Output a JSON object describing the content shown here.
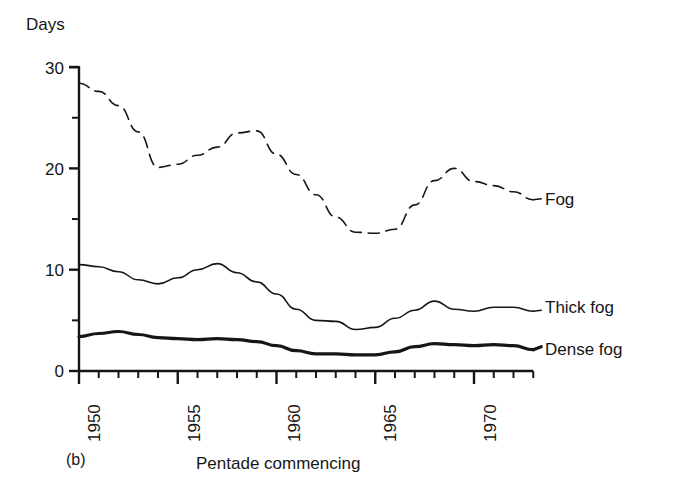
{
  "figure": {
    "panel_letter": "(b)",
    "y_axis_title": "Days",
    "x_axis_title": "Pentade commencing",
    "ink_color": "#161616",
    "background_color": "#ffffff"
  },
  "axes": {
    "y_tick_labels": [
      "30",
      "20",
      "10",
      "0"
    ],
    "y_minor_ticks": [
      25,
      15,
      5
    ],
    "x_tick_labels": [
      "1950",
      "1955",
      "1960",
      "1965",
      "1970"
    ]
  },
  "series_labels": {
    "fog": "Fog",
    "thick_fog": "Thick fog",
    "dense_fog": "Dense fog"
  },
  "chart_data": {
    "type": "line",
    "title": "",
    "subtitle": "",
    "xlabel": "Pentade commencing",
    "ylabel": "Days",
    "xlim": [
      1950,
      1973
    ],
    "ylim": [
      0,
      30
    ],
    "yticks": [
      0,
      5,
      10,
      15,
      20,
      25,
      30
    ],
    "ytick_labels_shown": [
      0,
      10,
      20,
      30
    ],
    "xticks": [
      1950,
      1951,
      1952,
      1953,
      1954,
      1955,
      1956,
      1957,
      1958,
      1959,
      1960,
      1961,
      1962,
      1963,
      1964,
      1965,
      1966,
      1967,
      1968,
      1969,
      1970,
      1971,
      1972,
      1973
    ],
    "xticks_labelled": [
      1950,
      1955,
      1960,
      1965,
      1970
    ],
    "grid": false,
    "legend_position": "right-inline-labels",
    "series": [
      {
        "name": "Fog",
        "style": "dashed",
        "line_width": 1.6,
        "label_at": {
          "x": 1973,
          "y": 17.0
        },
        "x": [
          1950,
          1951,
          1952,
          1953,
          1954,
          1955,
          1956,
          1957,
          1958,
          1959,
          1960,
          1961,
          1962,
          1963,
          1964,
          1965,
          1966,
          1967,
          1968,
          1969,
          1970,
          1971,
          1972,
          1973
        ],
        "values": [
          28.4,
          27.6,
          26.2,
          23.6,
          20.1,
          20.4,
          21.3,
          22.1,
          23.5,
          23.7,
          21.4,
          19.4,
          17.4,
          15.2,
          13.7,
          13.6,
          14.0,
          16.4,
          18.8,
          20.0,
          18.7,
          18.3,
          17.7,
          16.9
        ]
      },
      {
        "name": "Thick fog",
        "style": "solid-thin",
        "line_width": 1.6,
        "label_at": {
          "x": 1973,
          "y": 6.0
        },
        "x": [
          1950,
          1951,
          1952,
          1953,
          1954,
          1955,
          1956,
          1957,
          1958,
          1959,
          1960,
          1961,
          1962,
          1963,
          1964,
          1965,
          1966,
          1967,
          1968,
          1969,
          1970,
          1971,
          1972,
          1973
        ],
        "values": [
          10.5,
          10.3,
          9.8,
          9.0,
          8.6,
          9.2,
          10.0,
          10.6,
          9.7,
          8.8,
          7.6,
          6.1,
          5.0,
          4.9,
          4.1,
          4.3,
          5.2,
          6.0,
          6.9,
          6.1,
          5.9,
          6.3,
          6.3,
          5.9
        ]
      },
      {
        "name": "Dense fog",
        "style": "solid-thick",
        "line_width": 3.2,
        "label_at": {
          "x": 1973,
          "y": 2.4
        },
        "x": [
          1950,
          1951,
          1952,
          1953,
          1954,
          1955,
          1956,
          1957,
          1958,
          1959,
          1960,
          1961,
          1962,
          1963,
          1964,
          1965,
          1966,
          1967,
          1968,
          1969,
          1970,
          1971,
          1972,
          1973
        ],
        "values": [
          3.4,
          3.7,
          3.9,
          3.6,
          3.3,
          3.2,
          3.1,
          3.2,
          3.1,
          2.9,
          2.5,
          2.0,
          1.7,
          1.7,
          1.6,
          1.6,
          1.9,
          2.4,
          2.7,
          2.6,
          2.5,
          2.6,
          2.5,
          2.1
        ]
      }
    ]
  }
}
